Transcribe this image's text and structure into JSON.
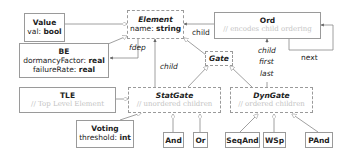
{
  "classes": {
    "value": {
      "name": "Value",
      "attr_name": "val:",
      "attr_type": "bool"
    },
    "element": {
      "name": "Element",
      "attr_name": "name:",
      "attr_type": "string"
    },
    "ord": {
      "name": "Ord",
      "comment": "// encodes child ordering"
    },
    "be": {
      "name": "BE",
      "attrs": [
        {
          "name": "dormancyFactor:",
          "type": "real"
        },
        {
          "name": "failureRate:",
          "type": "real"
        }
      ]
    },
    "gate": {
      "name": "Gate"
    },
    "tle": {
      "name": "TLE",
      "comment": "// Top Level Element"
    },
    "statgate": {
      "name": "StatGate",
      "comment": "// unordered children"
    },
    "dyngate": {
      "name": "DynGate",
      "comment": "// ordered children"
    },
    "voting": {
      "name": "Voting",
      "attr_name": "threshold:",
      "attr_type": "int"
    },
    "and": {
      "name": "And"
    },
    "or": {
      "name": "Or"
    },
    "seqand": {
      "name": "SeqAnd"
    },
    "wsp": {
      "name": "WSp"
    },
    "pand": {
      "name": "PAnd"
    }
  },
  "edge_labels": {
    "fdep": "fdep",
    "child_ord": "child",
    "child_statgate": "child",
    "dyn_child": "child",
    "dyn_first": "first",
    "dyn_last": "last",
    "next": "next"
  }
}
